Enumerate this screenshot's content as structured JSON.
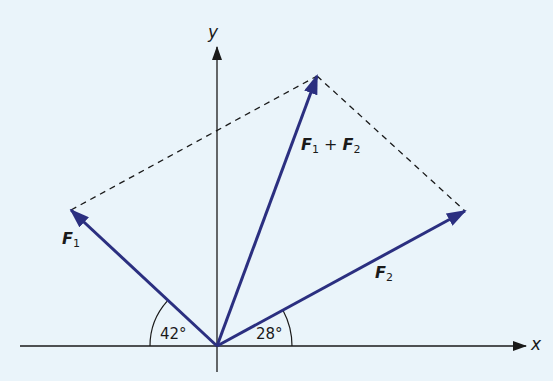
{
  "diagram": {
    "type": "vector-addition-parallelogram",
    "axes": {
      "x_label": "x",
      "y_label": "y"
    },
    "vectors": [
      {
        "name": "F1",
        "label_main": "F",
        "label_sub": "1",
        "angle_deg": 42,
        "direction": "left-of-y-axis",
        "color": "#2b2f80"
      },
      {
        "name": "F2",
        "label_main": "F",
        "label_sub": "2",
        "angle_deg": 28,
        "direction": "right-of-y-axis",
        "color": "#2b2f80"
      },
      {
        "name": "F1+F2",
        "label_a_main": "F",
        "label_a_sub": "1",
        "plus": "+",
        "label_b_main": "F",
        "label_b_sub": "2",
        "color": "#2b2f80"
      }
    ],
    "angles": {
      "left": "42°",
      "right": "28°"
    },
    "colors": {
      "background": "#eaf4fa",
      "vector": "#2b2f80",
      "axis": "#1a1a1a",
      "dashed": "#1a1a1a"
    }
  }
}
